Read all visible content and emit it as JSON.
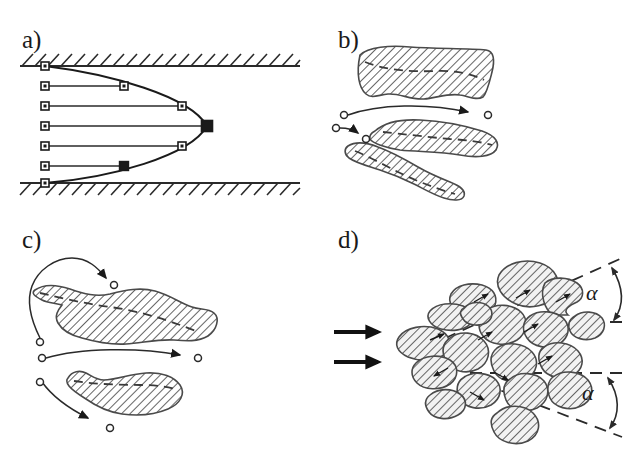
{
  "figure": {
    "background": "#ffffff",
    "width": 639,
    "height": 454,
    "ink_color": "#1a1a1a",
    "hatch_color": "#4a4a4a"
  },
  "panels": [
    {
      "id": "a",
      "label": "a)",
      "label_x": 22,
      "label_y": 48,
      "caption_meaning": "parabolic velocity profile between two hatched walls",
      "walls": {
        "top_y": 66,
        "bottom_y": 183,
        "x_start": 20,
        "x_end": 300,
        "hatch_count": 22,
        "hatch_length": 15
      },
      "profile": {
        "type": "parabola",
        "axis_x": 45,
        "vertex_x": 207,
        "vertex_y": 126,
        "marker_rows_y": [
          66,
          86,
          106,
          126,
          146,
          166,
          183
        ],
        "marker_tip_x": [
          45,
          124,
          182,
          207,
          182,
          124,
          45
        ],
        "marker_size_small": 8,
        "marker_size_large": 11
      }
    },
    {
      "id": "b",
      "label": "b)",
      "label_x": 338,
      "label_y": 48,
      "caption_meaning": "three elongated hatched particles with dashed centerlines and displacement arrows",
      "blob_count": 3,
      "arrow_count": 2
    },
    {
      "id": "c",
      "label": "c)",
      "label_x": 22,
      "label_y": 248,
      "caption_meaning": "two large hatched particles with curved displacement arrows",
      "blob_count": 2,
      "arrow_count": 3
    },
    {
      "id": "d",
      "label": "d)",
      "label_x": 338,
      "label_y": 248,
      "caption_meaning": "cluster of hatched particles dispersing in a cone of half-angle alpha",
      "inlet_arrows": 2,
      "particle_count": 18,
      "angle_labels": [
        {
          "symbol": "α",
          "x": 592,
          "y": 297,
          "position": "upper"
        },
        {
          "symbol": "α",
          "x": 592,
          "y": 394,
          "position": "lower"
        }
      ],
      "cone": {
        "apex_x": 408,
        "apex_y": 355,
        "upper_edge_end_x": 620,
        "upper_edge_end_y": 258,
        "lower_edge_end_x": 620,
        "lower_edge_end_y": 436,
        "mid_line_upper_y": 322,
        "mid_line_lower_y": 373
      }
    }
  ]
}
